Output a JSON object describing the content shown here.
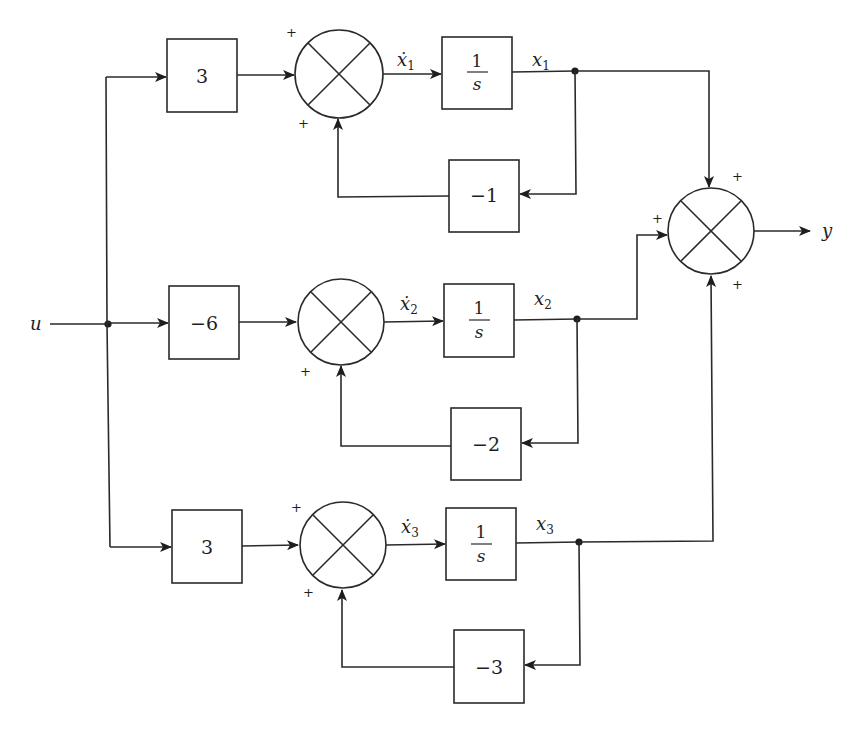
{
  "diagram": {
    "type": "block-diagram",
    "input_label": "u",
    "output_label": "y",
    "branches": [
      {
        "input_gain": "3",
        "summer_signs": [
          "+",
          "+"
        ],
        "derivative_label": "ẋ",
        "derivative_sub": "1",
        "integrator": {
          "num": "1",
          "den": "s"
        },
        "state_label": "x",
        "state_sub": "1",
        "feedback_gain": "−1"
      },
      {
        "input_gain": "−6",
        "summer_signs": [
          "+"
        ],
        "derivative_label": "ẋ",
        "derivative_sub": "2",
        "integrator": {
          "num": "1",
          "den": "s"
        },
        "state_label": "x",
        "state_sub": "2",
        "feedback_gain": "−2"
      },
      {
        "input_gain": "3",
        "summer_signs": [
          "+",
          "+"
        ],
        "derivative_label": "ẋ",
        "derivative_sub": "3",
        "integrator": {
          "num": "1",
          "den": "s"
        },
        "state_label": "x",
        "state_sub": "3",
        "feedback_gain": "−3"
      }
    ],
    "output_summer_signs": [
      "+",
      "+",
      "+"
    ]
  }
}
